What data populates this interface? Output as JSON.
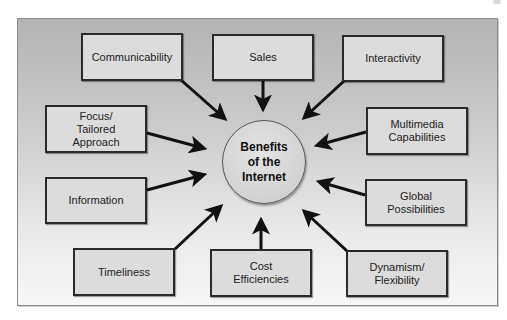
{
  "diagram": {
    "type": "hub-and-spoke",
    "center": {
      "label": "Benefits\nof the\nInternet"
    },
    "nodes": [
      {
        "id": "communicability",
        "label": "Communicability"
      },
      {
        "id": "sales",
        "label": "Sales"
      },
      {
        "id": "interactivity",
        "label": "Interactivity"
      },
      {
        "id": "focus",
        "label": "Focus/\nTailored\nApproach"
      },
      {
        "id": "multimedia",
        "label": "Multimedia\nCapabilities"
      },
      {
        "id": "information",
        "label": "Information"
      },
      {
        "id": "global",
        "label": "Global\nPossibilities"
      },
      {
        "id": "timeliness",
        "label": "Timeliness"
      },
      {
        "id": "cost",
        "label": "Cost\nEfficiencies"
      },
      {
        "id": "dynamism",
        "label": "Dynamism/\nFlexibility"
      }
    ],
    "edges_direction": "node-to-center",
    "colors": {
      "panel_top": "#b4b4b4",
      "panel_bottom": "#f7f7f7",
      "box_fill": "#dcdcdc",
      "box_border": "#2a2a2a",
      "arrow": "#111111",
      "hub_fill": "#d6d6d6"
    }
  }
}
